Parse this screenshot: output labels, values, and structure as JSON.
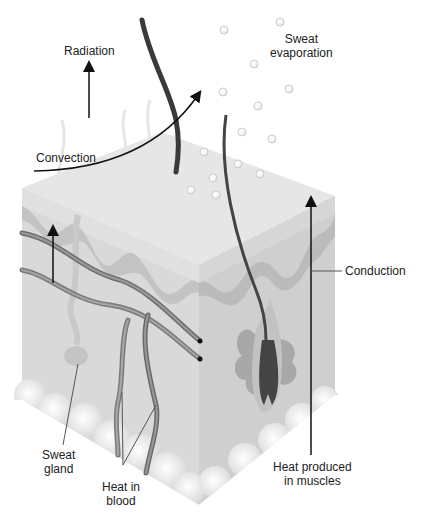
{
  "figure": {
    "type": "skin cross-section heat transfer diagram",
    "labels": {
      "radiation": "Radiation",
      "sweat_evaporation_1": "Sweat",
      "sweat_evaporation_2": "evaporation",
      "convection": "Convection",
      "conduction": "Conduction",
      "sweat_gland_1": "Sweat",
      "sweat_gland_2": "gland",
      "heat_in_blood_1": "Heat in",
      "heat_in_blood_2": "blood",
      "heat_muscles_1": "Heat produced",
      "heat_muscles_2": "in muscles"
    },
    "colors": {
      "background": "#ffffff",
      "top_face": "#e6e6e6",
      "left_face": "#d9d9d9",
      "right_face": "#d2d2d2",
      "dermis_wave": "#b8b8b8",
      "vessel": "#8a8a8a",
      "hair": "#3a3a3a",
      "fat": "#f0f0f0",
      "arrow": "#111111",
      "text": "#222222"
    }
  }
}
